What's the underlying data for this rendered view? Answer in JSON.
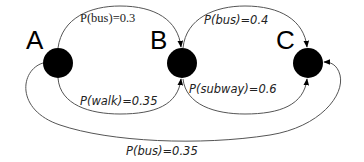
{
  "diagram": {
    "type": "state-transition-graph",
    "colors": {
      "node": "#000000",
      "edge": "#555555",
      "text": "#222222",
      "background": "#ffffff"
    },
    "nodes": [
      {
        "id": "A",
        "label": "A"
      },
      {
        "id": "B",
        "label": "B"
      },
      {
        "id": "C",
        "label": "C"
      }
    ],
    "edges": [
      {
        "from": "A",
        "to": "B",
        "label": "P(bus)=0.3",
        "mode": "bus",
        "probability": 0.3
      },
      {
        "from": "B",
        "to": "C",
        "label": "P(bus)=0.4",
        "mode": "bus",
        "probability": 0.4
      },
      {
        "from": "A",
        "to": "B",
        "label": "P(walk)=0.35",
        "mode": "walk",
        "probability": 0.35
      },
      {
        "from": "B",
        "to": "C",
        "label": "P(subway)=0.6",
        "mode": "subway",
        "probability": 0.6
      },
      {
        "from": "A",
        "to": "C",
        "label": "P(bus)=0.35",
        "mode": "bus",
        "probability": 0.35
      }
    ]
  }
}
